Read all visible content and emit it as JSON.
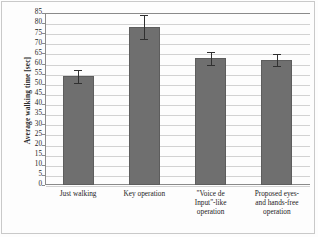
{
  "chart_data": {
    "type": "bar",
    "title": "",
    "xlabel": "",
    "ylabel": "Average walking time [sec]",
    "categories": [
      "Just walking",
      "Key operation",
      "\"Voice de Input\"-like operation",
      "Proposed eyes- and hands-free operation"
    ],
    "category_lines": [
      [
        "Just walking"
      ],
      [
        "Key operation"
      ],
      [
        "\"Voice de",
        "Input\"-like",
        "operation"
      ],
      [
        "Proposed eyes-",
        "and hands-free",
        "operation"
      ]
    ],
    "values": [
      54,
      78,
      63,
      62
    ],
    "errors_upper": [
      57,
      84,
      65.5,
      64.5
    ],
    "errors_lower": [
      50.5,
      72,
      59.5,
      59
    ],
    "ylim": [
      0,
      85
    ],
    "ytick_step": 5,
    "ytick_labels": [
      "85",
      "80",
      "75",
      "70",
      "65",
      "60",
      "55",
      "50",
      "45",
      "40",
      "35",
      "30",
      "25",
      "20",
      "15",
      "10",
      "5",
      "0"
    ],
    "grid": true,
    "legend": "none",
    "bar_color": "#6f6f6f",
    "error_color": "#303030",
    "grid_color": "#d2d2d2",
    "axis_color": "#8a8a8a"
  }
}
